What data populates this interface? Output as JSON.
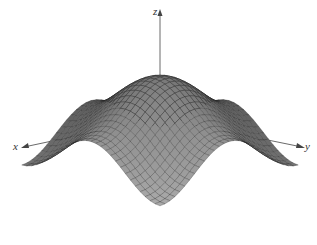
{
  "chart_data": {
    "type": "surface",
    "title": "",
    "function_description": "Egg-crate surface with central peak, four side peaks along the axes, and troughs between them (e.g. z = cos(x) + cos(y) style)",
    "xlabel": "x",
    "ylabel": "y",
    "zlabel": "z",
    "grid": false,
    "ticks": [],
    "legend": null,
    "shading": "grayscale, darker at back/center peak, lighter at front peak",
    "mesh": true,
    "domain": {
      "x": [
        -3.14159,
        3.14159
      ],
      "y": [
        -3.14159,
        3.14159
      ]
    },
    "samples": 28,
    "colors": {
      "back": "#3a3a3a",
      "side": "#707070",
      "front": "#b4b4b4",
      "mesh": "#222222",
      "axis": "#444444"
    }
  },
  "axes": {
    "x_label": "x",
    "y_label": "y",
    "z_label": "z"
  }
}
